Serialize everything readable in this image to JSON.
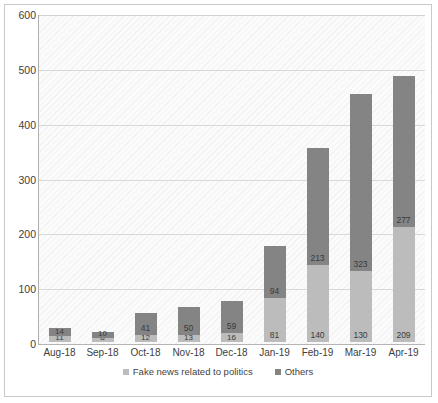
{
  "chart_data": {
    "type": "bar",
    "stacked": true,
    "title": "",
    "subtitle": "",
    "xlabel": "",
    "ylabel": "",
    "ylim": [
      0,
      600
    ],
    "ytick_step": 100,
    "yticks": [
      "600",
      "500",
      "400",
      "300",
      "200",
      "100",
      "0"
    ],
    "grid": true,
    "legend_position": "bottom",
    "categories": [
      "Aug-18",
      "Sep-18",
      "Oct-18",
      "Nov-18",
      "Dec-18",
      "Jan-19",
      "Feb-19",
      "Mar-19",
      "Apr-19"
    ],
    "series": [
      {
        "name": "Fake news related to politics",
        "color": "#bcbcbc",
        "values": [
          11,
          8,
          12,
          13,
          16,
          81,
          140,
          130,
          209
        ]
      },
      {
        "name": "Others",
        "color": "#848484",
        "values": [
          14,
          10,
          41,
          50,
          59,
          94,
          213,
          323,
          277
        ]
      }
    ],
    "totals": [
      25,
      18,
      53,
      63,
      75,
      175,
      353,
      453,
      486
    ]
  },
  "colors": {
    "series_politics": "#bcbcbc",
    "series_others": "#848484",
    "gridline": "#d9d9d9",
    "frame_border": "#c9c9c9",
    "plot_background": "#fbfbfb",
    "text": "#3f3f3f"
  }
}
